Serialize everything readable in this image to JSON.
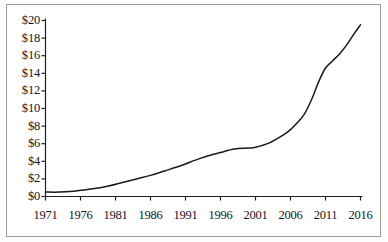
{
  "chart_data": {
    "type": "line",
    "title": "",
    "subtitle": "",
    "xlabel": "",
    "ylabel": "",
    "xlim": [
      1971,
      2016
    ],
    "ylim": [
      0,
      20
    ],
    "grid": false,
    "legend": null,
    "y_tick_labels": [
      "$20",
      "$18",
      "$16",
      "$14",
      "$12",
      "$10",
      "$8",
      "$6",
      "$4",
      "$2",
      "$0"
    ],
    "y_tick_values": [
      20,
      18,
      16,
      14,
      12,
      10,
      8,
      6,
      4,
      2,
      0
    ],
    "x_tick_labels": [
      "1971",
      "1976",
      "1981",
      "1986",
      "1991",
      "1996",
      "2001",
      "2006",
      "2011",
      "2016"
    ],
    "x_tick_values": [
      1971,
      1976,
      1981,
      1986,
      1991,
      1996,
      2001,
      2006,
      2011,
      2016
    ],
    "series": [
      {
        "name": "value",
        "color": "#1a1a1a",
        "x": [
          1971,
          1973,
          1975,
          1976,
          1978,
          1980,
          1982,
          1984,
          1986,
          1988,
          1990,
          1991,
          1993,
          1995,
          1996,
          1998,
          2000,
          2001,
          2003,
          2005,
          2006,
          2007,
          2008,
          2009,
          2010,
          2011,
          2012,
          2013,
          2014,
          2015,
          2016
        ],
        "values": [
          0.5,
          0.5,
          0.6,
          0.7,
          0.9,
          1.2,
          1.6,
          2.0,
          2.4,
          2.9,
          3.4,
          3.7,
          4.3,
          4.8,
          5.0,
          5.4,
          5.5,
          5.6,
          6.1,
          7.0,
          7.6,
          8.4,
          9.4,
          11.0,
          13.0,
          14.6,
          15.4,
          16.2,
          17.2,
          18.4,
          19.5
        ]
      }
    ]
  },
  "axes": {
    "y_axis_name": "dollar-axis",
    "x_axis_name": "year-axis"
  }
}
